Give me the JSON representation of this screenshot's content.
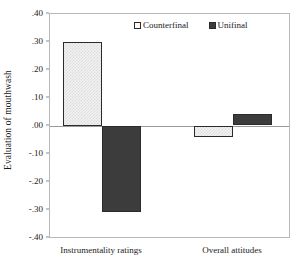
{
  "chart_data": {
    "type": "bar",
    "title": "",
    "subtitle": "",
    "xlabel": "",
    "ylabel": "Evaluation of mouthwash",
    "categories": [
      "Instrumentality ratings",
      "Overall attitudes"
    ],
    "series": [
      {
        "name": "Counterfinal",
        "values": [
          0.3,
          -0.04
        ],
        "color": "#f2f2f2",
        "edge_color": "#2b2b2b",
        "pattern": "light-hatched"
      },
      {
        "name": "Unifinal",
        "values": [
          -0.31,
          0.04
        ],
        "color": "#3c3c3c",
        "edge_color": "#2b2b2b",
        "pattern": "solid-dark"
      }
    ],
    "ylim": [
      -0.4,
      0.4
    ],
    "yticks": [
      0.4,
      0.3,
      0.2,
      0.1,
      0.0,
      -0.1,
      -0.2,
      -0.3,
      -0.4
    ],
    "ytick_labels": [
      ".40",
      ".30",
      ".20",
      ".10",
      ".00",
      "-.10",
      "-.20",
      "-.30",
      "-.40"
    ],
    "grid": false,
    "zero_line": true,
    "legend_position": "top-center",
    "frame": true
  },
  "legend": {
    "entries": [
      {
        "label": "Counterfinal",
        "marker": "open-square-swatch"
      },
      {
        "label": "Unifinal",
        "marker": "filled-square-swatch"
      }
    ]
  },
  "axes": {
    "y_title": "Evaluation of mouthwash",
    "y_tick_labels": [
      ".40",
      ".30",
      ".20",
      ".10",
      ".00",
      "-.10",
      "-.20",
      "-.30",
      "-.40"
    ],
    "x_tick_labels": [
      "Instrumentality ratings",
      "Overall attitudes"
    ]
  }
}
